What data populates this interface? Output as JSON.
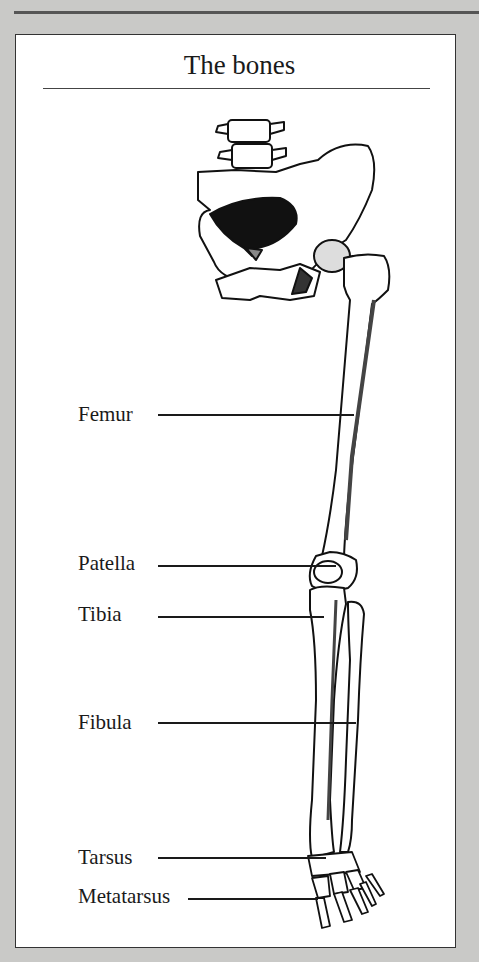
{
  "title": "The bones",
  "labels": [
    {
      "id": "femur",
      "text": "Femur"
    },
    {
      "id": "patella",
      "text": "Patella"
    },
    {
      "id": "tibia",
      "text": "Tibia"
    },
    {
      "id": "fibula",
      "text": "Fibula"
    },
    {
      "id": "tarsus",
      "text": "Tarsus"
    },
    {
      "id": "metatarsus",
      "text": "Metatarsus"
    }
  ],
  "colors": {
    "background": "#c9c9c7",
    "panel": "#ffffff",
    "ink": "#1a1a1a"
  }
}
